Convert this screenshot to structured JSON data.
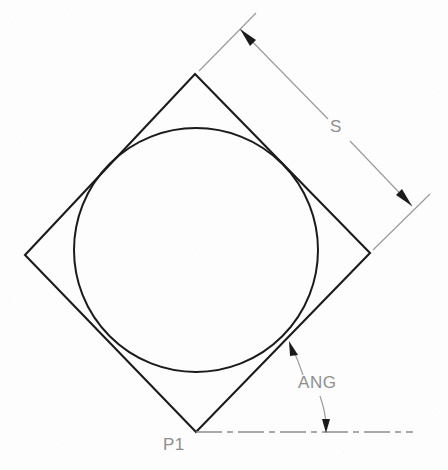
{
  "drawing": {
    "title": "Rotated square with inscribed circle",
    "canvas": {
      "width": 448,
      "height": 470
    },
    "background_color": "#fdfdfd",
    "geometry_color": "#1b1b1b",
    "annotation_color": "#8e8e8e"
  },
  "labels": {
    "size_dimension": "S",
    "angle_dimension": "ANG",
    "origin_point": "P1"
  },
  "shapes": {
    "square": {
      "name": "rotated-square",
      "vertices": [
        {
          "name": "top",
          "x": 195,
          "y": 74
        },
        {
          "name": "right",
          "x": 370,
          "y": 253
        },
        {
          "name": "bottom",
          "x": 196,
          "y": 432
        },
        {
          "name": "left",
          "x": 25,
          "y": 255
        }
      ]
    },
    "circle": {
      "name": "inscribed-circle",
      "cx": 196,
      "cy": 250,
      "r": 122
    },
    "centerline": {
      "name": "horizontal-centerline",
      "x1": 196,
      "y1": 432,
      "x2": 413,
      "y2": 432,
      "style": "dash-dot"
    }
  },
  "dimensions": {
    "size": {
      "name": "S",
      "label": "S",
      "label_x": 336,
      "label_y": 131,
      "arrow_start": {
        "x": 244,
        "y": 33
      },
      "arrow_end": {
        "x": 408,
        "y": 202
      },
      "extension_from_top_vertex": {
        "x1": 199,
        "y1": 71,
        "x2": 254,
        "y2": 15
      },
      "extension_from_right_vertex": {
        "x1": 373,
        "y1": 250,
        "x2": 428,
        "y2": 196
      }
    },
    "angle": {
      "name": "ANG",
      "label": "ANG",
      "label_x": 300,
      "label_y": 387,
      "arrow_tip_upper": {
        "x": 291,
        "y": 343
      },
      "arrow_tip_lower": {
        "x": 326,
        "y": 431
      }
    }
  },
  "point_labels": [
    {
      "name": "P1",
      "text": "P1",
      "x": 164,
      "y": 449
    }
  ]
}
